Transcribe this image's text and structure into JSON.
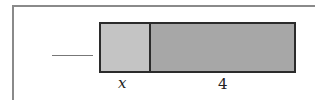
{
  "diagram": {
    "type": "tape-diagram",
    "answer_blank": "",
    "segments": [
      {
        "label": "x",
        "color": "#c4c4c4"
      },
      {
        "label": "4",
        "color": "#a7a7a7"
      }
    ]
  }
}
